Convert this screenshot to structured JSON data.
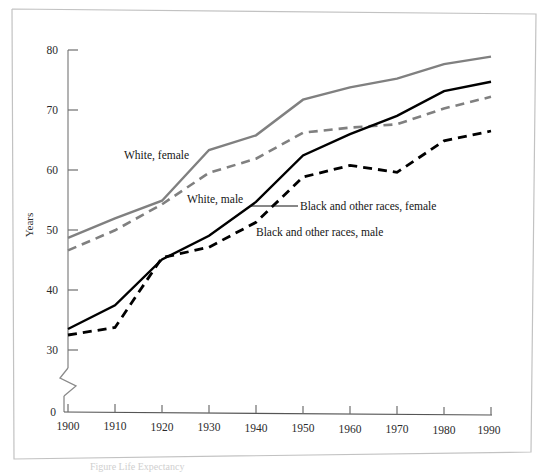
{
  "figure": {
    "border_color": "#b9b9b9",
    "caption": "Figure    Life Expectancy",
    "axis_label_y": "Years",
    "axis_break_note": "y-axis break between 0 and 30"
  },
  "chart_data": {
    "type": "line",
    "title": "",
    "xlabel": "",
    "ylabel": "Years",
    "x": [
      1900,
      1910,
      1920,
      1930,
      1940,
      1950,
      1960,
      1970,
      1980,
      1990
    ],
    "xtick_labels": [
      "1900",
      "1910",
      "1920",
      "1930",
      "1940",
      "1950",
      "1960",
      "1970",
      "1980",
      "1990"
    ],
    "ytick_labels": [
      "0",
      "30",
      "40",
      "50",
      "60",
      "70",
      "80"
    ],
    "ytick_values": [
      0,
      30,
      40,
      50,
      60,
      70,
      80
    ],
    "ylim": [
      30,
      80
    ],
    "xlim": [
      1900,
      1990
    ],
    "grid": false,
    "legend_position": "inline-annotations",
    "series": [
      {
        "name": "White, female",
        "color": "#808080",
        "style": "solid",
        "values": [
          48.7,
          52.0,
          55.0,
          63.5,
          66.0,
          72.0,
          74.1,
          75.6,
          78.1,
          79.4
        ]
      },
      {
        "name": "White, male",
        "color": "#808080",
        "style": "dashed",
        "values": [
          46.6,
          50.0,
          54.4,
          59.7,
          62.1,
          66.5,
          67.4,
          68.0,
          70.7,
          72.7
        ]
      },
      {
        "name": "Black and other races, female",
        "color": "#000000",
        "style": "solid",
        "values": [
          33.5,
          37.5,
          45.2,
          49.2,
          54.9,
          62.7,
          66.3,
          69.4,
          73.6,
          75.2
        ]
      },
      {
        "name": "Black and other races, male",
        "color": "#000000",
        "style": "dashed",
        "values": [
          32.5,
          33.8,
          45.5,
          47.3,
          51.5,
          59.1,
          61.1,
          60.0,
          65.3,
          67.0
        ]
      }
    ],
    "annotations": [
      {
        "text": "White, female",
        "x": 1902.5,
        "y": 64.0,
        "anchor": "start"
      },
      {
        "text": "White, male",
        "x": 1916.0,
        "y": 56.6,
        "anchor": "start"
      },
      {
        "text": "Black and other races, female",
        "x": 1934.0,
        "y": 55.2,
        "anchor": "start",
        "leader": true
      },
      {
        "text": "Black and other races, male",
        "x": 1929.0,
        "y": 51.4,
        "anchor": "start"
      }
    ]
  }
}
